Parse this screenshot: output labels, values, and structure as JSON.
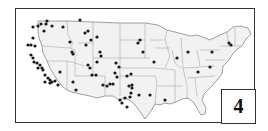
{
  "figure": {
    "panel_label": "4",
    "map_region": "Contiguous United States",
    "colors": {
      "land": "#f2f2f2",
      "borders": "#888888",
      "points": "#1a1a1a",
      "frame": "#333333"
    }
  },
  "points": [
    [
      33,
      27
    ],
    [
      38,
      26
    ],
    [
      41,
      24
    ],
    [
      46,
      24
    ],
    [
      47,
      21
    ],
    [
      52,
      26
    ],
    [
      44,
      31
    ],
    [
      33,
      38
    ],
    [
      28,
      45
    ],
    [
      31,
      45
    ],
    [
      35,
      46
    ],
    [
      31,
      55
    ],
    [
      33,
      58
    ],
    [
      34,
      62
    ],
    [
      37,
      63
    ],
    [
      40,
      65
    ],
    [
      42,
      68
    ],
    [
      43,
      70
    ],
    [
      45,
      75
    ],
    [
      48,
      78
    ],
    [
      50,
      80
    ],
    [
      52,
      82
    ],
    [
      55,
      81
    ],
    [
      38,
      68
    ],
    [
      45,
      82
    ],
    [
      50,
      83
    ],
    [
      60,
      72
    ],
    [
      58,
      85
    ],
    [
      63,
      27
    ],
    [
      80,
      20
    ],
    [
      85,
      33
    ],
    [
      88,
      31
    ],
    [
      70,
      42
    ],
    [
      72,
      52
    ],
    [
      73,
      54
    ],
    [
      86,
      45
    ],
    [
      91,
      40
    ],
    [
      97,
      37
    ],
    [
      100,
      52
    ],
    [
      101,
      56
    ],
    [
      97,
      62
    ],
    [
      88,
      65
    ],
    [
      90,
      68
    ],
    [
      73,
      82
    ],
    [
      76,
      90
    ],
    [
      92,
      75
    ],
    [
      96,
      75
    ],
    [
      103,
      85
    ],
    [
      107,
      86
    ],
    [
      110,
      84
    ],
    [
      115,
      73
    ],
    [
      113,
      84
    ],
    [
      117,
      77
    ],
    [
      116,
      63
    ],
    [
      119,
      67
    ],
    [
      127,
      76
    ],
    [
      131,
      74
    ],
    [
      132,
      85
    ],
    [
      129,
      86
    ],
    [
      131,
      93
    ],
    [
      125,
      98
    ],
    [
      120,
      100
    ],
    [
      122,
      103
    ],
    [
      127,
      107
    ],
    [
      130,
      97
    ],
    [
      132,
      88
    ],
    [
      138,
      43
    ],
    [
      140,
      40
    ],
    [
      143,
      52
    ],
    [
      139,
      95
    ],
    [
      150,
      95
    ],
    [
      154,
      62
    ],
    [
      165,
      100
    ],
    [
      177,
      58
    ],
    [
      188,
      52
    ],
    [
      198,
      72
    ],
    [
      212,
      52
    ],
    [
      229,
      43
    ],
    [
      231,
      45
    ],
    [
      226,
      104
    ],
    [
      210,
      67
    ]
  ]
}
